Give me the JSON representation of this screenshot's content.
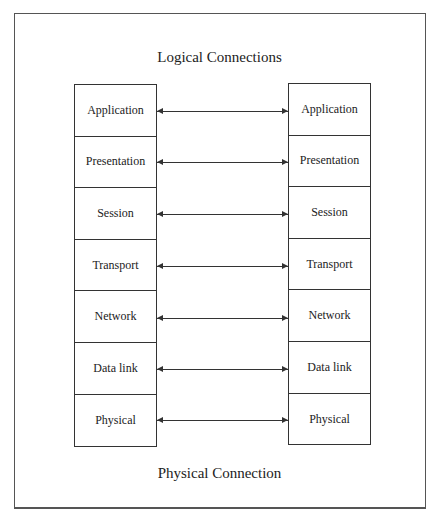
{
  "diagram": {
    "top_label": "Logical Connections",
    "bottom_label": "Physical Connection",
    "left_stack": [
      "Application",
      "Presentation",
      "Session",
      "Transport",
      "Network",
      "Data link",
      "Physical"
    ],
    "right_stack": [
      "Application",
      "Presentation",
      "Session",
      "Transport",
      "Network",
      "Data link",
      "Physical"
    ],
    "connections": "bidirectional arrows between each pair of corresponding layers"
  }
}
